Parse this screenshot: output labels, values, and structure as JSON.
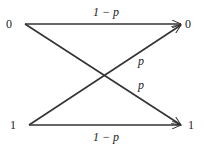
{
  "diagram": {
    "title": "",
    "inputs": [
      "0",
      "1"
    ],
    "outputs": [
      "0",
      "1"
    ],
    "edges": [
      {
        "from": "0",
        "to": "0",
        "label": "1 − p"
      },
      {
        "from": "1",
        "to": "0",
        "label": "p"
      },
      {
        "from": "0",
        "to": "1",
        "label": "p"
      },
      {
        "from": "1",
        "to": "1",
        "label": "1 − p"
      }
    ],
    "colors": {
      "line": "#333333",
      "text": "#222222"
    }
  }
}
